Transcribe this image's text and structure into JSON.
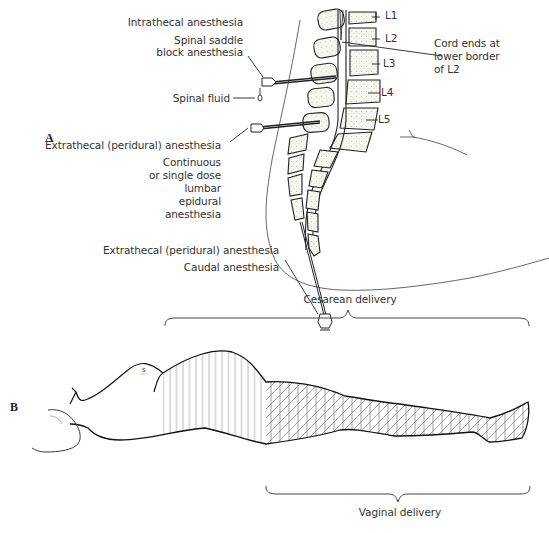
{
  "panel_a": {
    "letter": "A",
    "labels": {
      "intrathecal": "Intrathecal anesthesia",
      "saddle_line1": "Spinal saddle",
      "saddle_line2": "block anesthesia",
      "spinal_fluid": "Spinal fluid",
      "extrathecal_1": "Extrathecal (peridural) anesthesia",
      "continuous_lines": [
        "Continuous",
        "or single dose",
        "lumbar",
        "epidural",
        "anesthesia"
      ],
      "extrathecal_2": "Extrathecal (peridural) anesthesia",
      "caudal": "Caudal anesthesia",
      "cord_lines": [
        "Cord ends at",
        "lower border",
        "of L2"
      ]
    },
    "vertebra_labels": [
      "L1",
      "L2",
      "L3",
      "L4",
      "L5"
    ]
  },
  "panel_b": {
    "letter": "B",
    "cesarean_label": "Cesarean delivery",
    "vaginal_label": "Vaginal delivery"
  },
  "colors": {
    "line": "#222222",
    "hatch": "#888888",
    "bone_fill": "#efefe8"
  }
}
